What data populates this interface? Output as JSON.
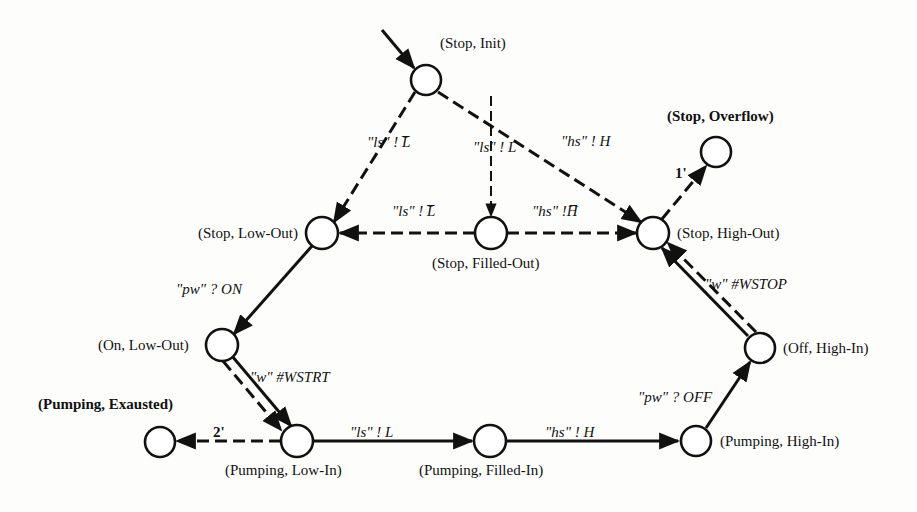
{
  "diagram": {
    "type": "state-transition-diagram",
    "states": [
      {
        "id": "stop_init",
        "label": "(Stop, Init)",
        "bold": false
      },
      {
        "id": "stop_overflow",
        "label": "(Stop, Overflow)",
        "bold": true
      },
      {
        "id": "stop_low_out",
        "label": "(Stop, Low-Out)",
        "bold": false
      },
      {
        "id": "stop_filled_out",
        "label": "(Stop, Filled-Out)",
        "bold": false
      },
      {
        "id": "stop_high_out",
        "label": "(Stop, High-Out)",
        "bold": false
      },
      {
        "id": "on_low_out",
        "label": "(On, Low-Out)",
        "bold": false
      },
      {
        "id": "off_high_in",
        "label": "(Off, High-In)",
        "bold": false
      },
      {
        "id": "pumping_exausted",
        "label": "(Pumping, Exausted)",
        "bold": true
      },
      {
        "id": "pumping_low_in",
        "label": "(Pumping, Low-In)",
        "bold": false
      },
      {
        "id": "pumping_filled_in",
        "label": "(Pumping, Filled-In)",
        "bold": false
      },
      {
        "id": "pumping_high_in",
        "label": "(Pumping, High-In)",
        "bold": false
      }
    ],
    "transitions": [
      {
        "from": "initial",
        "to": "stop_init",
        "label": "",
        "style": "solid"
      },
      {
        "from": "stop_init",
        "to": "stop_low_out",
        "label": "\"ls\" ! L̅",
        "style": "dashed"
      },
      {
        "from": "stop_init",
        "to": "stop_filled_out",
        "label": "\"ls\" ! L",
        "style": "dashed"
      },
      {
        "from": "stop_init",
        "to": "stop_high_out",
        "label": "\"hs\" ! H",
        "style": "dashed"
      },
      {
        "from": "stop_filled_out",
        "to": "stop_low_out",
        "label": "\"ls\" ! L̅",
        "style": "dashed"
      },
      {
        "from": "stop_filled_out",
        "to": "stop_high_out",
        "label": "\"hs\" !H̅",
        "style": "dashed"
      },
      {
        "from": "stop_high_out",
        "to": "stop_overflow",
        "label": "1'",
        "style": "dashed"
      },
      {
        "from": "stop_low_out",
        "to": "on_low_out",
        "label": "\"pw\" ? ON",
        "style": "solid"
      },
      {
        "from": "on_low_out",
        "to": "pumping_low_in",
        "label": "\"w\" #WSTRT",
        "style": "solid+dashed"
      },
      {
        "from": "pumping_low_in",
        "to": "pumping_exausted",
        "label": "2'",
        "style": "dashed"
      },
      {
        "from": "pumping_low_in",
        "to": "pumping_filled_in",
        "label": "\"ls\" ! L",
        "style": "solid"
      },
      {
        "from": "pumping_filled_in",
        "to": "pumping_high_in",
        "label": "\"hs\" ! H",
        "style": "solid"
      },
      {
        "from": "pumping_high_in",
        "to": "off_high_in",
        "label": "\"pw\" ? OFF",
        "style": "solid"
      },
      {
        "from": "off_high_in",
        "to": "stop_high_out",
        "label": "\"w\" #WSTOP",
        "style": "solid+dashed"
      }
    ]
  }
}
